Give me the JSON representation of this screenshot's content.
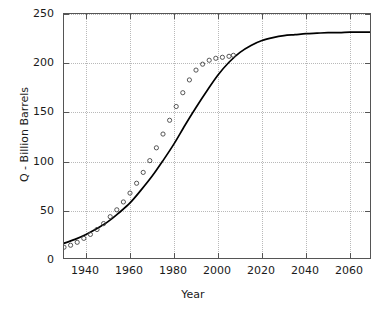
{
  "chart_data": {
    "type": "line",
    "title": "",
    "xlabel": "Year",
    "ylabel": "Q - Billion Barrels",
    "xlim": [
      1930,
      2070
    ],
    "ylim": [
      0,
      250
    ],
    "xticks": [
      1940,
      1960,
      1980,
      2000,
      2020,
      2040,
      2060
    ],
    "xticklabels": [
      "1940",
      "1960",
      "1980",
      "2000",
      "2020",
      "2040",
      "2060"
    ],
    "yticks": [
      0,
      50,
      100,
      150,
      200,
      250
    ],
    "yticklabels": [
      "0",
      "50",
      "100",
      "150",
      "200",
      "250"
    ],
    "grid": true,
    "legend": "none",
    "series": [
      {
        "name": "Logistic model fit",
        "style": "solid-line",
        "color": "#000000",
        "x": [
          1930,
          1935,
          1940,
          1945,
          1950,
          1955,
          1960,
          1965,
          1970,
          1975,
          1980,
          1985,
          1990,
          1995,
          2000,
          2005,
          2010,
          2015,
          2020,
          2025,
          2030,
          2035,
          2040,
          2045,
          2050,
          2055,
          2060,
          2065,
          2070
        ],
        "values": [
          17,
          21,
          26,
          32,
          39,
          48,
          58,
          71,
          85,
          101,
          118,
          137,
          155,
          172,
          188,
          201,
          211,
          218,
          223,
          226,
          228,
          229,
          230,
          230.5,
          231,
          231,
          231.5,
          231.5,
          231.5
        ]
      },
      {
        "name": "Observed cumulative production",
        "style": "open-circle-markers",
        "color": "#444444",
        "x": [
          1930,
          1933,
          1936,
          1939,
          1942,
          1945,
          1948,
          1951,
          1954,
          1957,
          1960,
          1963,
          1966,
          1969,
          1972,
          1975,
          1978,
          1981,
          1984,
          1987,
          1990,
          1993,
          1996,
          1999,
          2002,
          2005,
          2007
        ],
        "values": [
          13,
          15,
          18,
          22,
          26,
          31,
          37,
          44,
          51,
          59,
          68,
          78,
          89,
          101,
          114,
          128,
          142,
          156,
          170,
          183,
          193,
          199,
          203,
          205,
          206,
          207,
          208
        ]
      }
    ],
    "annotations": []
  },
  "figure": {
    "background_color": "#ffffff",
    "axis_color": "#555555",
    "grid_color": "#b9b9b9",
    "text_color": "#1a1a1a"
  }
}
